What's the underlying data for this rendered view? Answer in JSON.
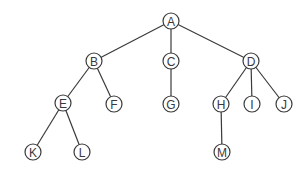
{
  "diagram": {
    "type": "tree",
    "colors": {
      "stroke": "#3a3a3a",
      "fill": "#ffffff"
    },
    "node_radius": 8,
    "nodes": [
      {
        "id": "A",
        "label": "A",
        "x": 171,
        "y": 21
      },
      {
        "id": "B",
        "label": "B",
        "x": 94,
        "y": 61
      },
      {
        "id": "C",
        "label": "C",
        "x": 171,
        "y": 61
      },
      {
        "id": "D",
        "label": "D",
        "x": 251,
        "y": 61
      },
      {
        "id": "E",
        "label": "E",
        "x": 63,
        "y": 103
      },
      {
        "id": "F",
        "label": "F",
        "x": 114,
        "y": 104
      },
      {
        "id": "G",
        "label": "G",
        "x": 171,
        "y": 104
      },
      {
        "id": "H",
        "label": "H",
        "x": 221,
        "y": 104
      },
      {
        "id": "I",
        "label": "I",
        "x": 252,
        "y": 104
      },
      {
        "id": "J",
        "label": "J",
        "x": 284,
        "y": 104
      },
      {
        "id": "K",
        "label": "K",
        "x": 33,
        "y": 152
      },
      {
        "id": "L",
        "label": "L",
        "x": 82,
        "y": 152
      },
      {
        "id": "M",
        "label": "M",
        "x": 222,
        "y": 152
      }
    ],
    "edges": [
      [
        "A",
        "B"
      ],
      [
        "A",
        "C"
      ],
      [
        "A",
        "D"
      ],
      [
        "B",
        "E"
      ],
      [
        "B",
        "F"
      ],
      [
        "C",
        "G"
      ],
      [
        "D",
        "H"
      ],
      [
        "D",
        "I"
      ],
      [
        "D",
        "J"
      ],
      [
        "E",
        "K"
      ],
      [
        "E",
        "L"
      ],
      [
        "H",
        "M"
      ]
    ]
  }
}
